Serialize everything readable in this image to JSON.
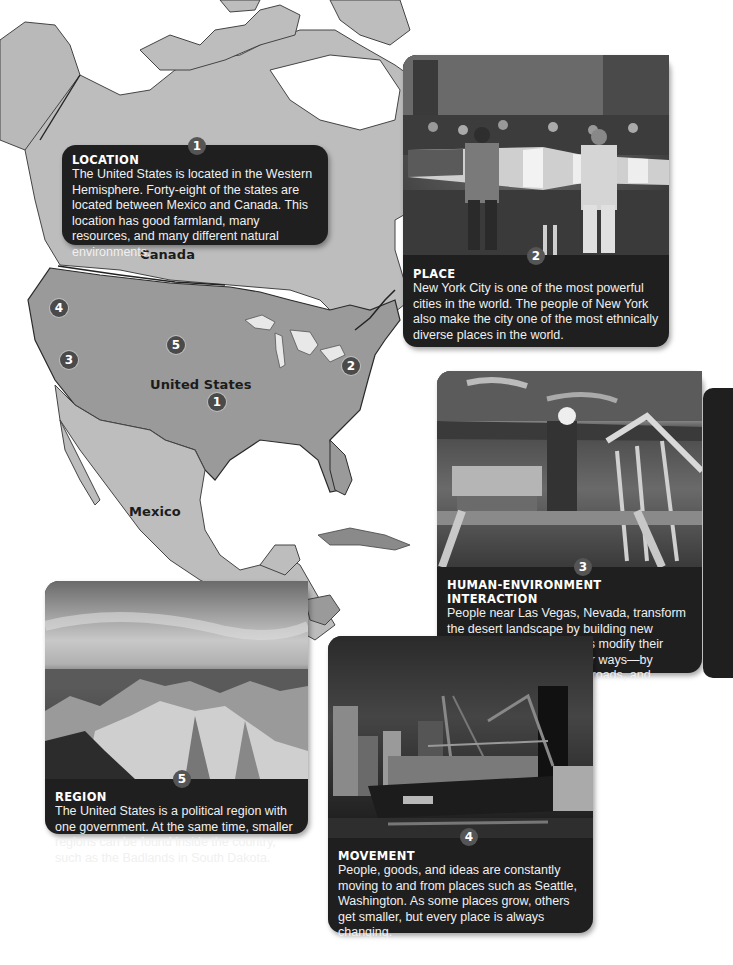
{
  "map": {
    "labels": {
      "canada": "Canada",
      "united_states": "United States",
      "mexico": "Mexico"
    },
    "markers": [
      {
        "number": "1",
        "theme": "location"
      },
      {
        "number": "2",
        "theme": "place"
      },
      {
        "number": "3",
        "theme": "human-environment interaction"
      },
      {
        "number": "4",
        "theme": "movement"
      },
      {
        "number": "5",
        "theme": "region"
      }
    ],
    "colors": {
      "us_fill": "#9a9a9a",
      "other_land": "#bdbdbd",
      "water": "#ffffff",
      "border": "#2a2a2a"
    }
  },
  "cards": {
    "location": {
      "number": "1",
      "title": "LOCATION",
      "text": "The United States is located in the Western Hemisphere. Forty-eight of the states are located between Mexico and Canada. This location has good farmland, many resources, and many different natural environments."
    },
    "place": {
      "number": "2",
      "title": "PLACE",
      "text": "New York City is one of the most powerful cities in the world. The people of New York also make the city one of the most ethnically diverse places in the world.",
      "photo": "parade with American flags on a New York street"
    },
    "human_environment": {
      "number": "3",
      "title": "HUMAN-ENVIRONMENT INTERACTION",
      "text": "People near Las Vegas, Nevada, transform the desert landscape by building new neighborhoods. Americans modify their environment in many other ways—by controlling rivers, building roads, and creating farmland.",
      "photo": "construction worker on roof trusses"
    },
    "movement": {
      "number": "4",
      "title": "MOVEMENT",
      "text": "People, goods, and ideas are constantly moving to and from places such as Seattle, Washington. As some places grow, others get smaller, but every place is always changing.",
      "photo": "container ship at Seattle port",
      "ship_text": "HANJIN"
    },
    "region": {
      "number": "5",
      "title": "REGION",
      "text": "The United States is a political region with one government. At the same time, smaller regions can be found inside the  country, such as the Badlands in South Dakota.",
      "photo": "Badlands landscape"
    }
  }
}
